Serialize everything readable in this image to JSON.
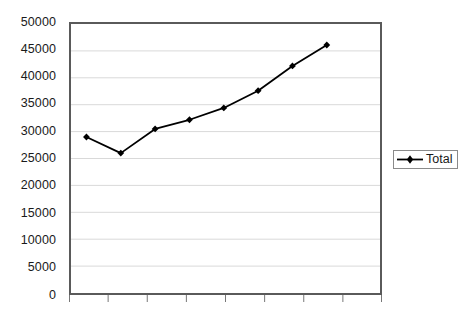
{
  "chart_data": {
    "type": "line",
    "title": "",
    "xlabel": "",
    "ylabel": "",
    "ylim": [
      0,
      50000
    ],
    "ytick_step": 5000,
    "ytick_labels": [
      "50000",
      "45000",
      "40000",
      "35000",
      "30000",
      "25000",
      "20000",
      "15000",
      "10000",
      "5000",
      "0"
    ],
    "ytick_values": [
      50000,
      45000,
      40000,
      35000,
      30000,
      25000,
      20000,
      15000,
      10000,
      5000,
      0
    ],
    "grid": "horizontal",
    "grid_color": "#d9d9d9",
    "legend_position": "right",
    "x": [
      1,
      2,
      3,
      4,
      5,
      6,
      7,
      8
    ],
    "categories": [
      "",
      "",
      "",
      "",
      "",
      "",
      "",
      ""
    ],
    "xtick_count": 9,
    "series": [
      {
        "name": "Total",
        "values": [
          29000,
          26000,
          30500,
          32200,
          34400,
          37600,
          42200,
          46100
        ],
        "color": "#000000",
        "marker": "diamond"
      }
    ]
  },
  "legend": {
    "entries": [
      {
        "label": "Total",
        "color": "#000000",
        "marker": "diamond"
      }
    ]
  },
  "colors": {
    "series": "#000000",
    "frame": "#5a5a5a",
    "grid": "#d9d9d9",
    "text": "#1a1a1a",
    "background": "#ffffff"
  }
}
